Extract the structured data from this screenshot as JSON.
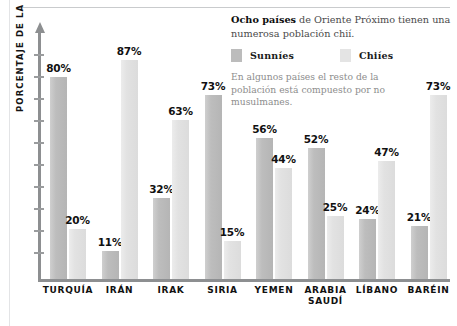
{
  "chart_data": {
    "type": "bar",
    "title": "Ocho países de Oriente Próximo tienen una numerosa población chií.",
    "xlabel": "",
    "ylabel": "PORCENTAJE DE LA POBLACIÓN",
    "ylim": [
      0,
      100
    ],
    "grid": false,
    "legend_position": "top-right",
    "categories": [
      "TURQUÍA",
      "IRÁN",
      "IRAK",
      "SIRIA",
      "YEMEN",
      "ARABIA SAUDÍ",
      "LÍBANO",
      "BARÉIN"
    ],
    "series": [
      {
        "name": "Sunníes",
        "color": "#bcbcbc",
        "values": [
          80,
          11,
          32,
          73,
          56,
          52,
          24,
          21
        ],
        "labels": [
          "80%",
          "11%",
          "32%",
          "73%",
          "56%",
          "52%",
          "24%",
          "21%"
        ]
      },
      {
        "name": "Chiíes",
        "color": "#e4e4e4",
        "values": [
          20,
          87,
          63,
          15,
          44,
          25,
          47,
          73
        ],
        "labels": [
          "20%",
          "87%",
          "63%",
          "15%",
          "44%",
          "25%",
          "47%",
          "73%"
        ]
      }
    ],
    "annotations": [
      "En algunos países el resto de la población está compuesto por no musulmanes."
    ]
  },
  "infobox": {
    "headline_bold": "Ocho países",
    "headline_rest": " de Oriente Próximo tienen una numerosa población chií.",
    "note": "En algunos países el resto de la población está compuesto por no musulmanes."
  },
  "legend": {
    "sunni_label": "Sunníes",
    "shia_label": "Chiíes"
  },
  "axis": {
    "y_title": "PORCENTAJE DE LA POBLACIÓN"
  },
  "categories": [
    {
      "line1": "TURQUÍA",
      "line2": ""
    },
    {
      "line1": "IRÁN",
      "line2": ""
    },
    {
      "line1": "IRAK",
      "line2": ""
    },
    {
      "line1": "SIRIA",
      "line2": ""
    },
    {
      "line1": "YEMEN",
      "line2": ""
    },
    {
      "line1": "ARABIA",
      "line2": "SAUDÍ"
    },
    {
      "line1": "LÍBANO",
      "line2": ""
    },
    {
      "line1": "BARÉIN",
      "line2": ""
    }
  ],
  "bar_labels": {
    "turquia_sunni": "80%",
    "turquia_shia": "20%",
    "iran_sunni": "11%",
    "iran_shia": "87%",
    "irak_sunni": "32%",
    "irak_shia": "63%",
    "siria_sunni": "73%",
    "siria_shia": "15%",
    "yemen_sunni": "56%",
    "yemen_shia": "44%",
    "arabia_sunni": "52%",
    "arabia_shia": "25%",
    "libano_sunni": "24%",
    "libano_shia": "47%",
    "barein_sunni": "21%",
    "barein_shia": "73%"
  },
  "colors": {
    "sunni": "#bcbcbc",
    "shia": "#e4e4e4",
    "axis": "#8d8f91",
    "text": "#111111",
    "note_text": "#8d8d8d"
  }
}
